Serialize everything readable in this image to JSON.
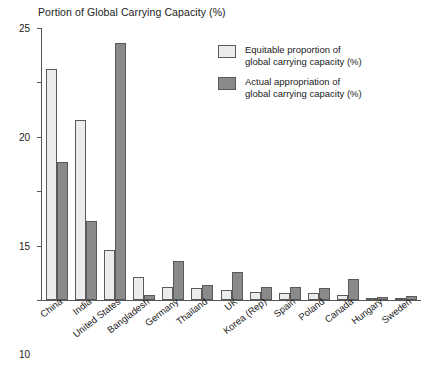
{
  "chart_data": {
    "type": "bar",
    "title": "Portion of Global Carrying Capacity (%)",
    "xlabel": "",
    "ylabel": "",
    "ylim": [
      0,
      25
    ],
    "yticks": [
      0,
      5,
      10,
      15,
      20,
      25
    ],
    "grid": false,
    "legend_position": "top-right",
    "categories": [
      "China",
      "India",
      "United States",
      "Bangladesh",
      "Germany",
      "Thailand",
      "UK",
      "Korea (Rep)",
      "Spain",
      "Poland",
      "Canada",
      "Hungary",
      "Sweden"
    ],
    "series": [
      {
        "name": "Equitable proportion of global carrying capacity (%)",
        "color": "#ececec",
        "values": [
          21.2,
          16.5,
          4.6,
          2.1,
          1.2,
          1.1,
          0.9,
          0.7,
          0.6,
          0.6,
          0.5,
          0.15,
          0.15
        ]
      },
      {
        "name": "Actual appropriation of global carrying capacity (%)",
        "color": "#8a8a8a",
        "values": [
          12.7,
          7.3,
          23.6,
          0.5,
          3.6,
          1.4,
          2.6,
          1.2,
          1.2,
          1.1,
          1.9,
          0.3,
          0.35
        ]
      }
    ]
  },
  "legend": {
    "items": [
      {
        "line1": "Equitable proportion of",
        "line2": "global carrying capacity (%)"
      },
      {
        "line1": "Actual appropriation of",
        "line2": "global carrying capacity (%)"
      }
    ]
  }
}
